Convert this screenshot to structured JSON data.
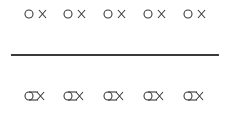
{
  "diagram": {
    "top_row": {
      "description": "separate circle and cross pairs",
      "items": [
        {
          "symbol": "o-x-separate"
        },
        {
          "symbol": "o-x-separate"
        },
        {
          "symbol": "o-x-separate"
        },
        {
          "symbol": "o-x-separate"
        },
        {
          "symbol": "o-x-separate"
        }
      ]
    },
    "divider": {
      "orientation": "horizontal"
    },
    "bottom_row": {
      "description": "circle joined to cross",
      "items": [
        {
          "symbol": "o-x-joined"
        },
        {
          "symbol": "o-x-joined"
        },
        {
          "symbol": "o-x-joined"
        },
        {
          "symbol": "o-x-joined"
        },
        {
          "symbol": "o-x-joined"
        }
      ]
    },
    "stroke_color": "#3a3a3a"
  }
}
